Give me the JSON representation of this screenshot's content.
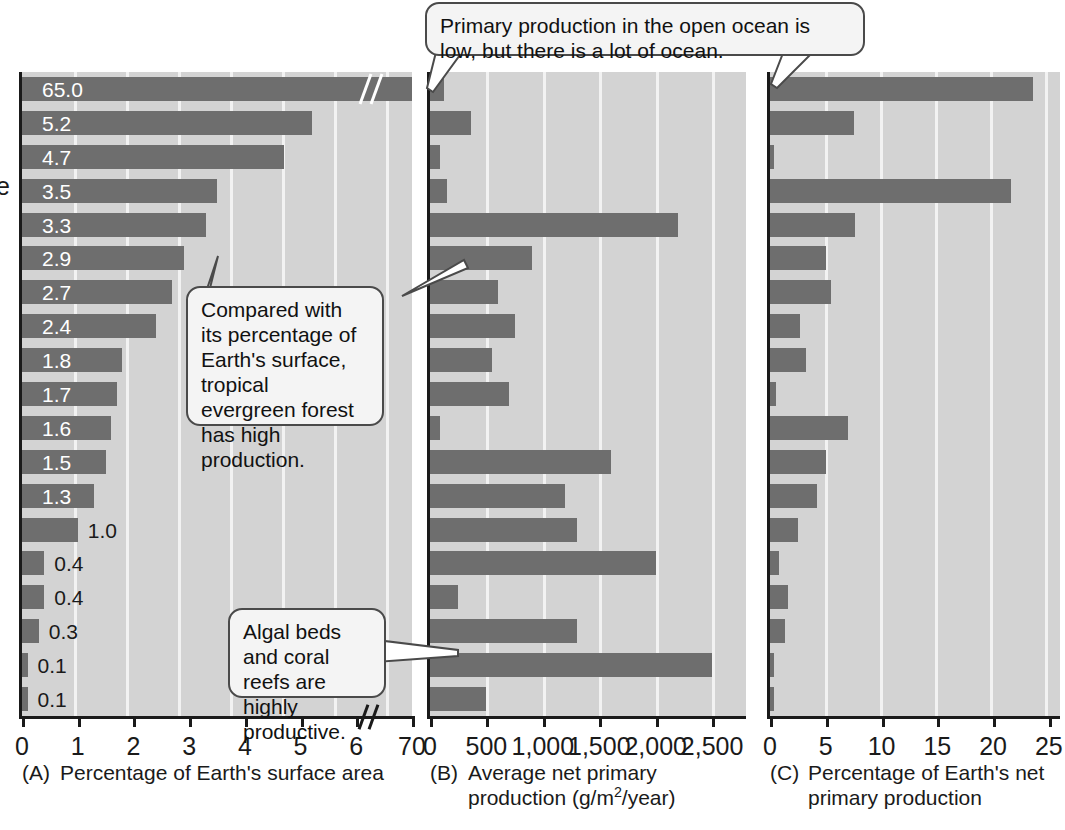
{
  "figure": {
    "ylabel_fragment": "e"
  },
  "callouts": [
    {
      "id": "open-ocean",
      "text": "Primary production in the open ocean is low, but there is a lot of ocean."
    },
    {
      "id": "tropical-forest",
      "text": "Compared with its percentage of Earth's surface, tropical evergreen forest has high production."
    },
    {
      "id": "algal-beds",
      "text": "Algal beds and coral reefs are highly productive."
    }
  ],
  "chart_data": [
    {
      "type": "bar",
      "panel": "A",
      "title": "Percentage of Earth's surface area",
      "xlabel": "Percentage of Earth's surface area",
      "ylabel": "",
      "orientation": "horizontal",
      "xlim": [
        0,
        7
      ],
      "axis_break": {
        "after": 6,
        "resumes_at": 70,
        "label": "70"
      },
      "ticks": [
        "0",
        "1",
        "2",
        "3",
        "4",
        "5",
        "6",
        "70"
      ],
      "tick_values": [
        0,
        1,
        2,
        3,
        4,
        5,
        6,
        7
      ],
      "grid": true,
      "show_value_labels": true,
      "values": [
        65.0,
        5.2,
        4.7,
        3.5,
        3.3,
        2.9,
        2.7,
        2.4,
        1.8,
        1.7,
        1.6,
        1.5,
        1.3,
        1.0,
        0.4,
        0.4,
        0.3,
        0.1,
        0.1
      ],
      "value_labels": [
        "65.0",
        "5.2",
        "4.7",
        "3.5",
        "3.3",
        "2.9",
        "2.7",
        "2.4",
        "1.8",
        "1.7",
        "1.6",
        "1.5",
        "1.3",
        "1.0",
        "0.4",
        "0.4",
        "0.3",
        "0.1",
        "0.1"
      ]
    },
    {
      "type": "bar",
      "panel": "B",
      "title": "Average net primary production (g/m2/year)",
      "xlabel_line1": "Average net primary",
      "xlabel_line2_pre": "production (g/m",
      "xlabel_sup": "2",
      "xlabel_line2_post": "/year)",
      "orientation": "horizontal",
      "xlim": [
        0,
        2800
      ],
      "ticks": [
        "0",
        "500",
        "1,000",
        "1,500",
        "2,000",
        "2,500"
      ],
      "tick_values": [
        0,
        500,
        1000,
        1500,
        2000,
        2500
      ],
      "grid": true,
      "show_value_labels": false,
      "values": [
        125,
        360,
        90,
        150,
        2200,
        900,
        600,
        750,
        550,
        700,
        90,
        1600,
        1200,
        1300,
        2000,
        250,
        1300,
        2500,
        500
      ]
    },
    {
      "type": "bar",
      "panel": "C",
      "title": "Percentage of Earth's net primary production",
      "xlabel_line1": "Percentage of Earth's net",
      "xlabel_line2": "primary production",
      "orientation": "horizontal",
      "xlim": [
        0,
        26
      ],
      "ticks": [
        "0",
        "5",
        "10",
        "15",
        "20",
        "25"
      ],
      "tick_values": [
        0,
        5,
        10,
        15,
        20,
        25
      ],
      "grid": true,
      "show_value_labels": false,
      "values": [
        23.6,
        7.5,
        0.4,
        21.6,
        7.6,
        5.0,
        5.5,
        2.7,
        3.2,
        0.5,
        7.0,
        5.0,
        4.2,
        2.5,
        0.8,
        1.6,
        1.3,
        0.4,
        0.3
      ]
    }
  ]
}
